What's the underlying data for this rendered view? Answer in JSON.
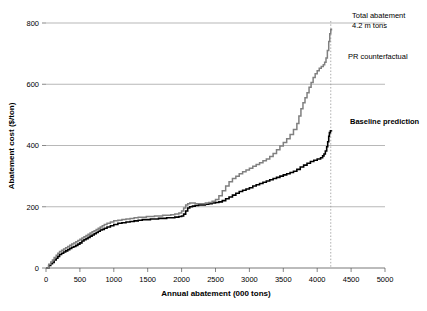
{
  "chart_data": {
    "type": "line",
    "title": "",
    "xlabel": "Annual abatement (000 tons)",
    "ylabel": "Abatement cost ($/ton)",
    "xlim": [
      0,
      5000
    ],
    "ylim": [
      0,
      800
    ],
    "xticks": [
      "0",
      "500",
      "1000",
      "1500",
      "2000",
      "2500",
      "3000",
      "3500",
      "4000",
      "4500",
      "5000"
    ],
    "yticks": [
      "0",
      "200",
      "400",
      "600",
      "800"
    ],
    "grid": "horizontal",
    "legend": "none",
    "series": [
      {
        "name": "Baseline prediction",
        "color": "#000000",
        "style": "step",
        "points": [
          [
            0,
            0
          ],
          [
            40,
            8
          ],
          [
            70,
            14
          ],
          [
            95,
            18
          ],
          [
            120,
            26
          ],
          [
            150,
            32
          ],
          [
            175,
            38
          ],
          [
            200,
            44
          ],
          [
            230,
            48
          ],
          [
            260,
            52
          ],
          [
            290,
            56
          ],
          [
            320,
            60
          ],
          [
            350,
            64
          ],
          [
            380,
            68
          ],
          [
            410,
            70
          ],
          [
            440,
            74
          ],
          [
            470,
            78
          ],
          [
            500,
            82
          ],
          [
            530,
            88
          ],
          [
            560,
            92
          ],
          [
            590,
            96
          ],
          [
            620,
            100
          ],
          [
            650,
            104
          ],
          [
            680,
            108
          ],
          [
            710,
            112
          ],
          [
            740,
            116
          ],
          [
            770,
            120
          ],
          [
            800,
            124
          ],
          [
            830,
            126
          ],
          [
            860,
            130
          ],
          [
            900,
            134
          ],
          [
            950,
            138
          ],
          [
            1000,
            142
          ],
          [
            1060,
            146
          ],
          [
            1120,
            148
          ],
          [
            1180,
            150
          ],
          [
            1240,
            152
          ],
          [
            1300,
            154
          ],
          [
            1360,
            156
          ],
          [
            1420,
            158
          ],
          [
            1480,
            158
          ],
          [
            1540,
            160
          ],
          [
            1600,
            160
          ],
          [
            1660,
            162
          ],
          [
            1720,
            162
          ],
          [
            1780,
            164
          ],
          [
            1840,
            164
          ],
          [
            1900,
            166
          ],
          [
            1960,
            168
          ],
          [
            2000,
            170
          ],
          [
            2030,
            176
          ],
          [
            2060,
            186
          ],
          [
            2090,
            196
          ],
          [
            2120,
            200
          ],
          [
            2160,
            202
          ],
          [
            2200,
            204
          ],
          [
            2250,
            206
          ],
          [
            2300,
            206
          ],
          [
            2350,
            208
          ],
          [
            2400,
            210
          ],
          [
            2450,
            212
          ],
          [
            2500,
            214
          ],
          [
            2550,
            216
          ],
          [
            2600,
            220
          ],
          [
            2650,
            226
          ],
          [
            2700,
            232
          ],
          [
            2750,
            238
          ],
          [
            2800,
            244
          ],
          [
            2850,
            250
          ],
          [
            2900,
            254
          ],
          [
            2950,
            258
          ],
          [
            3000,
            262
          ],
          [
            3050,
            268
          ],
          [
            3100,
            272
          ],
          [
            3150,
            276
          ],
          [
            3200,
            280
          ],
          [
            3250,
            284
          ],
          [
            3300,
            288
          ],
          [
            3350,
            292
          ],
          [
            3400,
            296
          ],
          [
            3450,
            300
          ],
          [
            3500,
            304
          ],
          [
            3550,
            308
          ],
          [
            3600,
            312
          ],
          [
            3650,
            316
          ],
          [
            3700,
            322
          ],
          [
            3750,
            330
          ],
          [
            3800,
            336
          ],
          [
            3850,
            342
          ],
          [
            3900,
            348
          ],
          [
            3950,
            352
          ],
          [
            4000,
            356
          ],
          [
            4050,
            360
          ],
          [
            4080,
            366
          ],
          [
            4100,
            372
          ],
          [
            4120,
            382
          ],
          [
            4140,
            396
          ],
          [
            4155,
            412
          ],
          [
            4170,
            430
          ],
          [
            4180,
            442
          ],
          [
            4195,
            448
          ],
          [
            4210,
            450
          ]
        ]
      },
      {
        "name": "PR counterfactual",
        "color": "#808080",
        "style": "step",
        "points": [
          [
            0,
            0
          ],
          [
            40,
            12
          ],
          [
            70,
            20
          ],
          [
            95,
            26
          ],
          [
            120,
            34
          ],
          [
            150,
            42
          ],
          [
            175,
            48
          ],
          [
            200,
            54
          ],
          [
            230,
            58
          ],
          [
            260,
            62
          ],
          [
            290,
            66
          ],
          [
            320,
            70
          ],
          [
            350,
            74
          ],
          [
            380,
            78
          ],
          [
            410,
            82
          ],
          [
            440,
            86
          ],
          [
            470,
            90
          ],
          [
            500,
            94
          ],
          [
            530,
            98
          ],
          [
            560,
            102
          ],
          [
            590,
            106
          ],
          [
            620,
            110
          ],
          [
            650,
            114
          ],
          [
            680,
            118
          ],
          [
            710,
            122
          ],
          [
            740,
            126
          ],
          [
            770,
            130
          ],
          [
            800,
            134
          ],
          [
            830,
            138
          ],
          [
            860,
            142
          ],
          [
            900,
            146
          ],
          [
            950,
            150
          ],
          [
            1000,
            154
          ],
          [
            1060,
            156
          ],
          [
            1120,
            158
          ],
          [
            1180,
            160
          ],
          [
            1240,
            162
          ],
          [
            1300,
            164
          ],
          [
            1360,
            166
          ],
          [
            1420,
            166
          ],
          [
            1480,
            168
          ],
          [
            1540,
            168
          ],
          [
            1600,
            170
          ],
          [
            1660,
            170
          ],
          [
            1720,
            172
          ],
          [
            1780,
            172
          ],
          [
            1840,
            174
          ],
          [
            1900,
            176
          ],
          [
            1960,
            180
          ],
          [
            2000,
            186
          ],
          [
            2030,
            196
          ],
          [
            2060,
            206
          ],
          [
            2090,
            210
          ],
          [
            2120,
            212
          ],
          [
            2160,
            212
          ],
          [
            2200,
            210
          ],
          [
            2250,
            210
          ],
          [
            2300,
            210
          ],
          [
            2350,
            212
          ],
          [
            2400,
            214
          ],
          [
            2450,
            218
          ],
          [
            2500,
            224
          ],
          [
            2550,
            236
          ],
          [
            2600,
            252
          ],
          [
            2650,
            268
          ],
          [
            2700,
            282
          ],
          [
            2750,
            292
          ],
          [
            2800,
            300
          ],
          [
            2850,
            308
          ],
          [
            2900,
            314
          ],
          [
            2950,
            320
          ],
          [
            3000,
            326
          ],
          [
            3050,
            332
          ],
          [
            3100,
            338
          ],
          [
            3150,
            344
          ],
          [
            3200,
            350
          ],
          [
            3250,
            356
          ],
          [
            3300,
            364
          ],
          [
            3350,
            374
          ],
          [
            3400,
            386
          ],
          [
            3450,
            398
          ],
          [
            3500,
            410
          ],
          [
            3550,
            422
          ],
          [
            3600,
            436
          ],
          [
            3650,
            452
          ],
          [
            3700,
            472
          ],
          [
            3730,
            496
          ],
          [
            3760,
            520
          ],
          [
            3790,
            540
          ],
          [
            3820,
            556
          ],
          [
            3850,
            572
          ],
          [
            3880,
            590
          ],
          [
            3910,
            606
          ],
          [
            3940,
            622
          ],
          [
            3970,
            634
          ],
          [
            4000,
            644
          ],
          [
            4030,
            652
          ],
          [
            4060,
            658
          ],
          [
            4090,
            664
          ],
          [
            4110,
            672
          ],
          [
            4130,
            686
          ],
          [
            4150,
            710
          ],
          [
            4170,
            740
          ],
          [
            4185,
            765
          ],
          [
            4200,
            778
          ],
          [
            4210,
            782
          ]
        ]
      }
    ],
    "marker_line": {
      "x": 4200,
      "style": "dotted",
      "color": "#999999"
    },
    "annotations": [
      {
        "id": "total-abatement",
        "line1": "Total abatement",
        "line2": "4.2 m tons",
        "x": 352,
        "y": 18
      },
      {
        "id": "pr-counterfactual",
        "text": "PR counterfactual",
        "x": 348,
        "y": 59
      },
      {
        "id": "baseline-prediction",
        "text": "Baseline prediction",
        "x": 350,
        "y": 124
      }
    ]
  }
}
